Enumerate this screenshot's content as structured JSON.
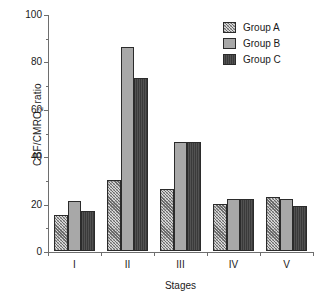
{
  "chart_data": {
    "type": "bar",
    "title": "",
    "xlabel": "Stages",
    "ylabel": "CBF/CMRO2 ratio",
    "ylabel_parts": {
      "pre": "CBF/CMRO",
      "sub": "2",
      "post": " ratio"
    },
    "categories": [
      "I",
      "II",
      "III",
      "IV",
      "V"
    ],
    "series": [
      {
        "name": "Group A",
        "values": [
          15,
          30,
          26,
          20,
          23
        ],
        "style": "hatched-light-gray",
        "color": "#d9d9d9"
      },
      {
        "name": "Group B",
        "values": [
          21,
          86,
          46,
          22,
          22
        ],
        "style": "solid-medium-gray",
        "color": "#a8a8a8"
      },
      {
        "name": "Group C",
        "values": [
          17,
          73,
          46,
          22,
          19
        ],
        "style": "solid-dark-gray",
        "color": "#3a3a3a"
      }
    ],
    "ylim": [
      0,
      100
    ],
    "ytick_major": [
      0,
      20,
      40,
      60,
      80,
      100
    ],
    "ytick_minor": [
      10,
      30,
      50,
      70,
      90
    ],
    "grid": false,
    "legend_position": "top-right"
  },
  "legend": {
    "entries": [
      {
        "label": "Group A"
      },
      {
        "label": "Group B"
      },
      {
        "label": "Group C"
      }
    ]
  }
}
